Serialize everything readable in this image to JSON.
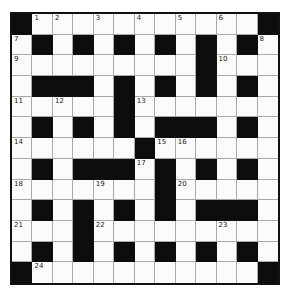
{
  "puzzle": {
    "rows": 13,
    "cols": 13,
    "colors": {
      "black_cell": "#0c0c0c",
      "white_cell": "#fbfbfb",
      "grid_line": "#a9a9a9"
    },
    "layout": [
      "#...........#",
      ".#.#.#.#.#.#.",
      ".........#...",
      ".###.#.#.#.#.",
      ".....#.......",
      ".#.#.#.###.#.",
      "......#......",
      ".#.###.#.#.#.",
      ".......#.....",
      ".#.#.#.#.###.",
      "...#.........",
      ".#.#.#.#.#.#.",
      "#...........#"
    ],
    "numbers": [
      {
        "r": 0,
        "c": 1,
        "n": "1"
      },
      {
        "r": 0,
        "c": 2,
        "n": "2"
      },
      {
        "r": 0,
        "c": 4,
        "n": "3"
      },
      {
        "r": 0,
        "c": 6,
        "n": "4"
      },
      {
        "r": 0,
        "c": 8,
        "n": "5"
      },
      {
        "r": 0,
        "c": 10,
        "n": "6"
      },
      {
        "r": 1,
        "c": 0,
        "n": "7"
      },
      {
        "r": 1,
        "c": 12,
        "n": "8"
      },
      {
        "r": 2,
        "c": 0,
        "n": "9"
      },
      {
        "r": 2,
        "c": 10,
        "n": "10"
      },
      {
        "r": 4,
        "c": 0,
        "n": "11"
      },
      {
        "r": 4,
        "c": 2,
        "n": "12"
      },
      {
        "r": 4,
        "c": 6,
        "n": "13"
      },
      {
        "r": 6,
        "c": 0,
        "n": "14"
      },
      {
        "r": 6,
        "c": 7,
        "n": "15"
      },
      {
        "r": 6,
        "c": 8,
        "n": "16"
      },
      {
        "r": 7,
        "c": 6,
        "n": "17"
      },
      {
        "r": 8,
        "c": 0,
        "n": "18"
      },
      {
        "r": 8,
        "c": 4,
        "n": "19"
      },
      {
        "r": 8,
        "c": 8,
        "n": "20"
      },
      {
        "r": 10,
        "c": 0,
        "n": "21"
      },
      {
        "r": 10,
        "c": 4,
        "n": "22"
      },
      {
        "r": 10,
        "c": 10,
        "n": "23"
      },
      {
        "r": 12,
        "c": 1,
        "n": "24"
      }
    ]
  }
}
